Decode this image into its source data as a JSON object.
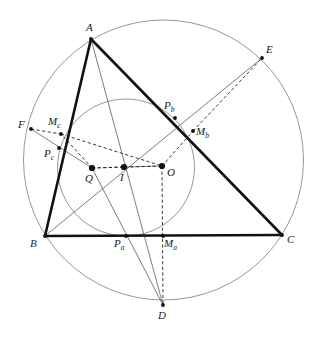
{
  "figure": {
    "kind": "euclidean-geometry-diagram",
    "background_color": "#ffffff",
    "stroke_colors": {
      "triangle": "#111111",
      "circle": "#8a8a8a",
      "thin_line": "#6e6e6e",
      "dashed": "#222222",
      "point": "#111111",
      "label": "#1a1a1a"
    },
    "canvas": {
      "width": 315,
      "height": 338
    }
  },
  "labels": {
    "A": "A",
    "B": "B",
    "C": "C",
    "D": "D",
    "E": "E",
    "F": "F",
    "I": "I",
    "O": "O",
    "Q": "Q",
    "Pa": "P",
    "Pa_sub": "a",
    "Pb": "P",
    "Pb_sub": "b",
    "Pc": "P",
    "Pc_sub": "c",
    "Ma": "M",
    "Ma_sub": "a",
    "Mb": "M",
    "Mb_sub": "b",
    "Mc": "M",
    "Mc_sub": "c"
  },
  "geometry": {
    "points": {
      "A": {
        "x": 91,
        "y": 39
      },
      "B": {
        "x": 45,
        "y": 236
      },
      "C": {
        "x": 282,
        "y": 235
      },
      "D": {
        "x": 163,
        "y": 305
      },
      "E": {
        "x": 262,
        "y": 58
      },
      "F": {
        "x": 31,
        "y": 129
      },
      "I": {
        "x": 124,
        "y": 167
      },
      "O": {
        "x": 162,
        "y": 166
      },
      "Q": {
        "x": 92,
        "y": 168
      },
      "Pa": {
        "x": 126,
        "y": 236
      },
      "Pb": {
        "x": 175,
        "y": 118
      },
      "Pc": {
        "x": 59,
        "y": 148
      },
      "Ma": {
        "x": 163,
        "y": 236
      },
      "Mb": {
        "x": 193,
        "y": 131
      },
      "Mc": {
        "x": 61,
        "y": 134
      }
    },
    "circles": {
      "circumcircle": {
        "cx": 163.5,
        "cy": 160,
        "r": 140
      },
      "nine_point_circle": {
        "cx": 126,
        "cy": 167.5,
        "r": 68.5
      }
    },
    "label_offsets": {
      "A": {
        "x": 86,
        "y": 22
      },
      "B": {
        "x": 30,
        "y": 238
      },
      "C": {
        "x": 287,
        "y": 234
      },
      "D": {
        "x": 158,
        "y": 310
      },
      "E": {
        "x": 266,
        "y": 44
      },
      "F": {
        "x": 18,
        "y": 119
      },
      "I": {
        "x": 120,
        "y": 172
      },
      "O": {
        "x": 167,
        "y": 167
      },
      "Q": {
        "x": 85,
        "y": 173
      },
      "Pa": {
        "x": 114,
        "y": 238
      },
      "Pb": {
        "x": 164,
        "y": 100
      },
      "Pc": {
        "x": 44,
        "y": 148
      },
      "Ma": {
        "x": 164,
        "y": 238
      },
      "Mb": {
        "x": 196,
        "y": 126
      },
      "Mc": {
        "x": 48,
        "y": 116
      }
    }
  },
  "elements": {
    "triangle_sides": [
      {
        "name": "side-AB",
        "from": "A",
        "to": "B"
      },
      {
        "name": "side-BC",
        "from": "B",
        "to": "C"
      },
      {
        "name": "side-CA",
        "from": "C",
        "to": "A"
      }
    ],
    "thin_lines": [
      {
        "name": "line-F-to-Pc-Q",
        "from": "F",
        "to": "Q"
      },
      {
        "name": "line-Q-to-D",
        "from": "Q",
        "to": "D"
      },
      {
        "name": "line-B-through-Pb-to-E",
        "from": "B",
        "to": "E"
      },
      {
        "name": "line-D-to-A-through-Pb",
        "from": "D",
        "to": "A"
      }
    ],
    "dashed_lines": [
      {
        "name": "dashed-F-to-Mc",
        "from": "F",
        "to": "Mc"
      },
      {
        "name": "dashed-Mc-to-O",
        "from": "Mc",
        "to": "O"
      },
      {
        "name": "dashed-Q-to-Mc",
        "from": "Q",
        "to": "Mc"
      },
      {
        "name": "dashed-Q-to-I",
        "from": "Q",
        "to": "I"
      },
      {
        "name": "dashed-I-to-O",
        "from": "I",
        "to": "O"
      },
      {
        "name": "dashed-O-to-Mb",
        "from": "O",
        "to": "Mb"
      },
      {
        "name": "dashed-Mb-to-E",
        "from": "Mb",
        "to": "E"
      },
      {
        "name": "dashed-O-to-Ma-to-D",
        "from": "O",
        "to": "D"
      },
      {
        "name": "dashed-Q-to-O",
        "from": "Q",
        "to": "O"
      }
    ],
    "marked_points": [
      "Q",
      "I",
      "O",
      "A",
      "B",
      "C",
      "D",
      "E",
      "F",
      "Pa",
      "Pb",
      "Pc",
      "Ma",
      "Mb",
      "Mc"
    ]
  }
}
